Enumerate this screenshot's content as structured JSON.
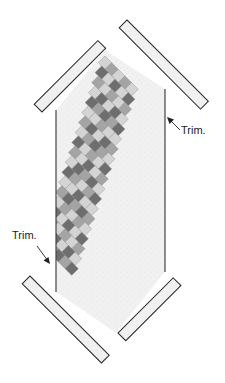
{
  "diagram": {
    "labels": {
      "trim_right": "Trim.",
      "trim_left": "Trim."
    },
    "colors": {
      "dark": "#6e6e6e",
      "medium": "#a4a4a4",
      "light": "#d4d4d4",
      "lightest": "#ececec",
      "background_fabric": "#f1f1f1",
      "outline": "#222222"
    },
    "grid": {
      "columns": 5,
      "rows": 19,
      "pattern": [
        "LMLML",
        "DLDLD",
        "MLMLM",
        "LDLDL",
        "DMDMD",
        "LLMLL",
        "MDLDM",
        "LMDML",
        "DLMLD",
        "MLDLM",
        "LDMDL",
        "DMLMD",
        "LLDLL",
        "MDMDM",
        "LMLML",
        "DLDLD",
        "MLMLM",
        "LDLDL",
        "DMDMD"
      ]
    }
  }
}
